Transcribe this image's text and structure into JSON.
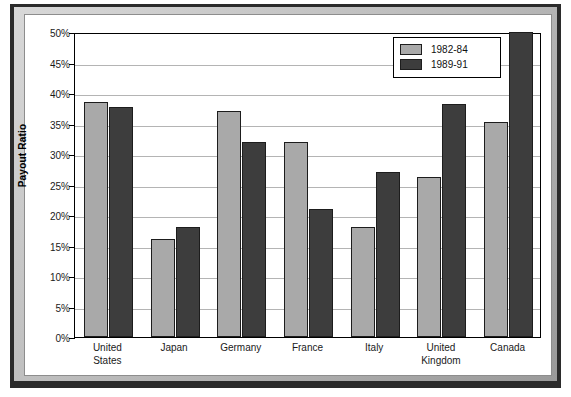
{
  "chart_data": {
    "type": "bar",
    "title": "",
    "xlabel": "",
    "ylabel": "Payout Ratio",
    "ylim": [
      0,
      50
    ],
    "ytick_step": 5,
    "ytick_labels": [
      "0%",
      "5%",
      "10%",
      "15%",
      "20%",
      "25%",
      "30%",
      "35%",
      "40%",
      "45%",
      "50%"
    ],
    "grid": true,
    "legend_position": "top-right",
    "categories": [
      "United States",
      "Japan",
      "Germany",
      "France",
      "Italy",
      "United Kingdom",
      "Canada"
    ],
    "category_lines": [
      [
        "United",
        "States"
      ],
      [
        "Japan"
      ],
      [
        "Germany"
      ],
      [
        "France"
      ],
      [
        "Italy"
      ],
      [
        "United",
        "Kingdom"
      ],
      [
        "Canada"
      ]
    ],
    "series": [
      {
        "name": "1982-84",
        "color": "#a9a9a9",
        "values": [
          38.5,
          16.0,
          37.0,
          32.0,
          18.0,
          26.2,
          35.2
        ]
      },
      {
        "name": "1989-91",
        "color": "#3d3d3d",
        "values": [
          37.7,
          18.0,
          32.0,
          21.0,
          27.0,
          38.2,
          50.0
        ]
      }
    ]
  },
  "legend": {
    "entries": [
      {
        "label": "1982-84",
        "swatch": "light-gray"
      },
      {
        "label": "1989-91",
        "swatch": "dark-gray"
      }
    ]
  },
  "colors": {
    "series_light": "#a9a9a9",
    "series_dark": "#3d3d3d",
    "gridline": "#b4b4b4",
    "axis": "#000000",
    "frame_dark": "#2b2b2b",
    "plot_background": "#ffffff"
  }
}
